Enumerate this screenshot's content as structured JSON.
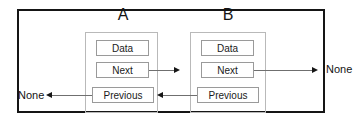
{
  "diagram": {
    "frame_color": "#151515",
    "node_border_color": "#b9b9b9",
    "field_border_color": "#9a9a9a",
    "line_color": "#6f6f6f",
    "arrow_color": "#161616",
    "background": "#ffffff"
  },
  "nodes": [
    {
      "label": "A",
      "fields": {
        "data": "Data",
        "next": "Next",
        "previous": "Previous"
      }
    },
    {
      "label": "B",
      "fields": {
        "data": "Data",
        "next": "Next",
        "previous": "Previous"
      }
    }
  ],
  "terminals": {
    "left_none": "None",
    "right_none": "None"
  },
  "connections": [
    {
      "from": "A.next",
      "to": "B",
      "direction": "right"
    },
    {
      "from": "B.next",
      "to": "None",
      "direction": "right"
    },
    {
      "from": "B.previous",
      "to": "A",
      "direction": "left"
    },
    {
      "from": "A.previous",
      "to": "None",
      "direction": "left"
    }
  ]
}
